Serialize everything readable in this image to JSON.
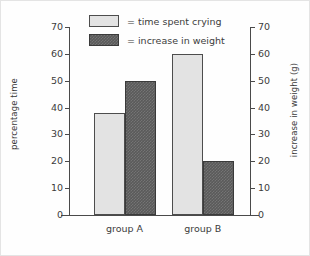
{
  "chart_data": {
    "type": "bar",
    "title": "",
    "categories": [
      "group A",
      "group B"
    ],
    "series": [
      {
        "name": "time spent crying",
        "legend_label": "= time spent crying",
        "axis": "left",
        "color": "#e3e3e3",
        "values": [
          38,
          60
        ]
      },
      {
        "name": "increase in weight",
        "legend_label": "= increase in weight",
        "axis": "right",
        "color": "#5a5a5a",
        "values": [
          50,
          20
        ]
      }
    ],
    "xlabel": "",
    "ylabel": "percentage time",
    "ylabel_right": "increase in weight (g)",
    "ylim": [
      0,
      70
    ],
    "ylim_right": [
      0,
      70
    ],
    "yticks": [
      0,
      10,
      20,
      30,
      40,
      50,
      60,
      70
    ],
    "yticks_right": [
      0,
      10,
      20,
      30,
      40,
      50,
      60,
      70
    ],
    "ytick_labels": [
      "0",
      "10",
      "20",
      "30",
      "40",
      "50",
      "60",
      "70"
    ],
    "ytick_labels_right": [
      "0",
      "10",
      "20",
      "30",
      "40",
      "50",
      "60",
      "70"
    ],
    "grid": false,
    "legend_position": "top-center"
  }
}
